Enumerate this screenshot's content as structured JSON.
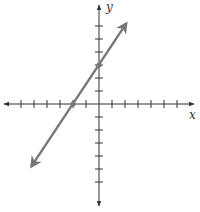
{
  "chart_data": {
    "type": "line",
    "title": "",
    "xlabel": "x",
    "ylabel": "y",
    "xlim": [
      -7,
      7
    ],
    "ylim": [
      -7,
      7
    ],
    "grid": false,
    "x_ticks": [
      -6,
      -5,
      -4,
      -3,
      -2,
      -1,
      1,
      2,
      3,
      4,
      5,
      6
    ],
    "y_ticks": [
      -6,
      -5,
      -4,
      -3,
      -2,
      -1,
      1,
      2,
      3,
      4,
      5,
      6
    ],
    "series": [
      {
        "name": "line",
        "equation": "y = 1.5x + 3",
        "slope": 1.5,
        "intercept": 3,
        "x": [
          -5.2,
          2.1
        ],
        "y": [
          -4.8,
          6.2
        ],
        "marked_points": [
          {
            "x": -2,
            "y": 0
          },
          {
            "x": 0,
            "y": 3
          }
        ],
        "color": "#777777"
      }
    ]
  },
  "axes": {
    "x_label": "x",
    "y_label": "y",
    "color": "#333333"
  }
}
